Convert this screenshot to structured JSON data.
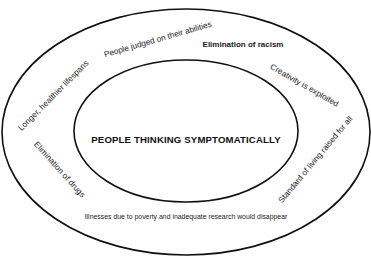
{
  "diagram": {
    "type": "concentric-ellipses",
    "stroke_color": "#111111",
    "background_color": "#ffffff",
    "outer_ellipse": {
      "cx": 186,
      "cy": 132,
      "rx": 184,
      "ry": 123
    },
    "inner_ellipse": {
      "cx": 186,
      "cy": 131,
      "rx": 112,
      "ry": 71
    },
    "center_text": "PEOPLE THINKING SYMPTOMATICALLY",
    "outcomes": [
      {
        "id": "lifespans",
        "text": "Longer, healthier lifespans"
      },
      {
        "id": "abilities",
        "text": "People judged on their abilities"
      },
      {
        "id": "racism",
        "text": "Elimination of racism"
      },
      {
        "id": "creativity",
        "text": "Creativity is exploited"
      },
      {
        "id": "standard-of-living",
        "text": "Standard of living raised for all"
      },
      {
        "id": "drugs",
        "text": "Elimination of drugs"
      },
      {
        "id": "illnesses",
        "text": "Illnesses due to poverty and inadequate research would disappear"
      }
    ]
  }
}
